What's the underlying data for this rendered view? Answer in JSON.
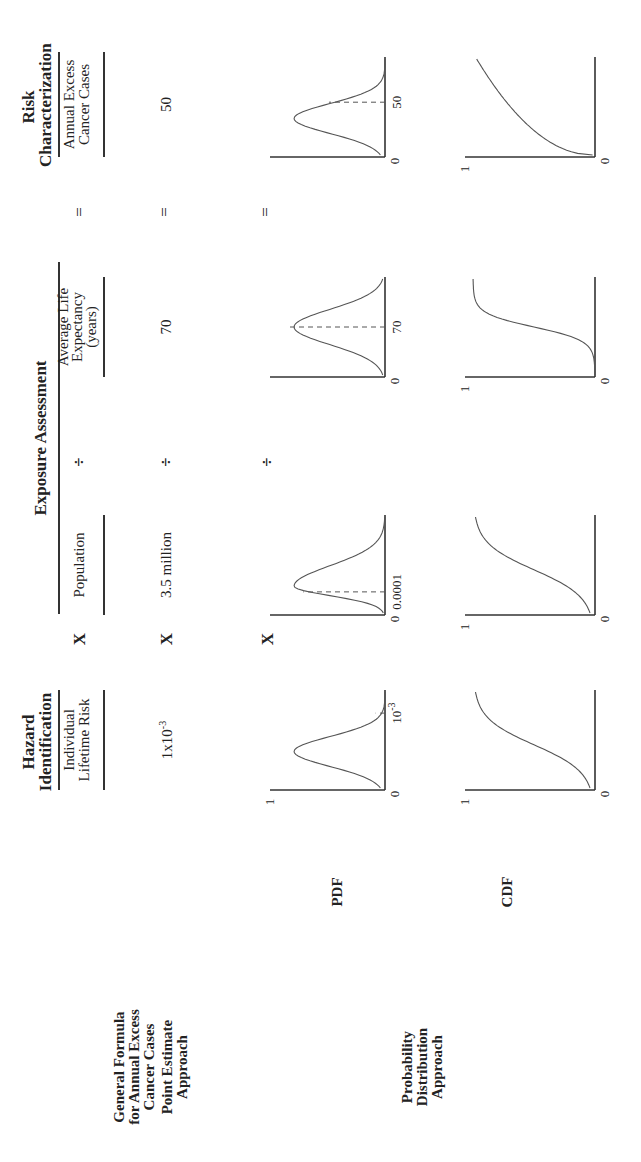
{
  "headers": {
    "hazard": [
      "Hazard",
      "Identification"
    ],
    "exposure": "Exposure  Assessment",
    "risk": [
      "Risk",
      "Characterization"
    ]
  },
  "row_labels": {
    "formula": [
      "General Formula",
      "for Annual Excess",
      "Cancer Cases"
    ],
    "point": [
      "Point Estimate",
      "Approach"
    ],
    "probability": [
      "Probability",
      "Distribution",
      "Approach"
    ],
    "pdf": "PDF",
    "cdf": "CDF"
  },
  "formula_terms": {
    "individual_risk": [
      "Individual",
      "Lifetime Risk"
    ],
    "population": "Population",
    "life_expectancy": [
      "Average Life",
      "Expectancy",
      "(years)"
    ],
    "annual_cases": [
      "Annual Excess",
      "Cancer Cases"
    ]
  },
  "operators": {
    "multiply": "X",
    "divide": "÷",
    "equals": "="
  },
  "point_values": {
    "individual_risk_base": "1x10",
    "individual_risk_exp": "-3",
    "population": "3.5 million",
    "life_expectancy": "70",
    "annual_cases": "50"
  },
  "chart_data": [
    {
      "type": "line",
      "title": "PDF - Individual Lifetime Risk",
      "shape": "skewed-bell",
      "ytick_labels": [
        "0",
        "1"
      ],
      "xtick_label_base": "10",
      "xtick_label_exp": "-3",
      "marker": "dashed line at 10^-3"
    },
    {
      "type": "line",
      "title": "PDF - Population",
      "shape": "peaked-bell",
      "ytick_labels": [
        "0"
      ],
      "xtick_label": "0.0001",
      "marker": "dashed line at 0.0001"
    },
    {
      "type": "line",
      "title": "PDF - Average Life Expectancy",
      "shape": "symmetric-bell",
      "ytick_labels": [
        "0"
      ],
      "xtick_label": "70",
      "marker": "dashed line at 70"
    },
    {
      "type": "line",
      "title": "PDF - Annual Excess Cancer Cases",
      "shape": "skewed-bell",
      "ytick_labels": [
        "0"
      ],
      "xtick_label": "50",
      "marker": "dashed line at 50"
    },
    {
      "type": "line",
      "title": "CDF - Individual Lifetime Risk",
      "shape": "s-curve",
      "ytick_labels": [
        "0",
        "1"
      ]
    },
    {
      "type": "line",
      "title": "CDF - Population",
      "shape": "s-curve",
      "ytick_labels": [
        "0",
        "1"
      ]
    },
    {
      "type": "line",
      "title": "CDF - Average Life Expectancy",
      "shape": "steep-s-curve",
      "ytick_labels": [
        "0",
        "1"
      ]
    },
    {
      "type": "line",
      "title": "CDF - Annual Excess Cancer Cases",
      "shape": "concave-rise",
      "ytick_labels": [
        "0",
        "1"
      ]
    }
  ]
}
